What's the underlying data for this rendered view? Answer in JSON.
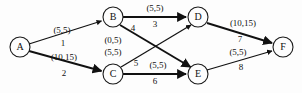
{
  "diagram": {
    "background_color": "#fdfdfd",
    "stroke_color": "#111111",
    "nodes": [
      {
        "id": "A",
        "label": "A",
        "cx": 20,
        "cy": 47,
        "r": 10
      },
      {
        "id": "B",
        "label": "B",
        "cx": 113,
        "cy": 17,
        "r": 10
      },
      {
        "id": "C",
        "label": "C",
        "cx": 113,
        "cy": 74,
        "r": 10
      },
      {
        "id": "D",
        "label": "D",
        "cx": 198,
        "cy": 17,
        "r": 10
      },
      {
        "id": "E",
        "label": "E",
        "cx": 198,
        "cy": 74,
        "r": 10
      },
      {
        "id": "F",
        "label": "F",
        "cx": 283,
        "cy": 47,
        "r": 10
      }
    ],
    "edges": [
      {
        "id": "a-b",
        "from": "A",
        "to": "B",
        "capacity_label": "(5,5)",
        "number_label": "1"
      },
      {
        "id": "a-c",
        "from": "A",
        "to": "C",
        "capacity_label": "(10,15)",
        "number_label": "2"
      },
      {
        "id": "b-d",
        "from": "B",
        "to": "D",
        "capacity_label": "(5,5)",
        "number_label": "3"
      },
      {
        "id": "b-e",
        "from": "B",
        "to": "E",
        "capacity_label": "(0,5)",
        "number_label": "4"
      },
      {
        "id": "c-d",
        "from": "C",
        "to": "D",
        "capacity_label": "(5,5)",
        "number_label": "5"
      },
      {
        "id": "c-e",
        "from": "C",
        "to": "E",
        "capacity_label": "(5,5)",
        "number_label": "6"
      },
      {
        "id": "d-f",
        "from": "D",
        "to": "F",
        "capacity_label": "(10,15)",
        "number_label": "7"
      },
      {
        "id": "e-f",
        "from": "E",
        "to": "F",
        "capacity_label": "(5,5)",
        "number_label": "8"
      }
    ]
  }
}
